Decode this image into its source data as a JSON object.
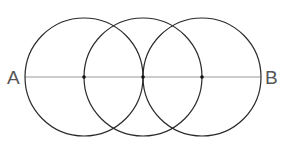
{
  "labels": {
    "left": "A",
    "right": "B"
  },
  "geometry": {
    "circles": [
      {
        "cx": 84,
        "cy": 77,
        "r": 59
      },
      {
        "cx": 143,
        "cy": 77,
        "r": 59
      },
      {
        "cx": 202,
        "cy": 77,
        "r": 59
      }
    ],
    "segment": {
      "x1": 25,
      "y1": 77,
      "x2": 261,
      "y2": 77
    },
    "points": [
      {
        "x": 84,
        "y": 77
      },
      {
        "x": 143,
        "y": 77
      },
      {
        "x": 202,
        "y": 77
      }
    ]
  },
  "colors": {
    "circle": "#2a2a2a",
    "segment": "#9a9a9a",
    "label": "#555555"
  }
}
